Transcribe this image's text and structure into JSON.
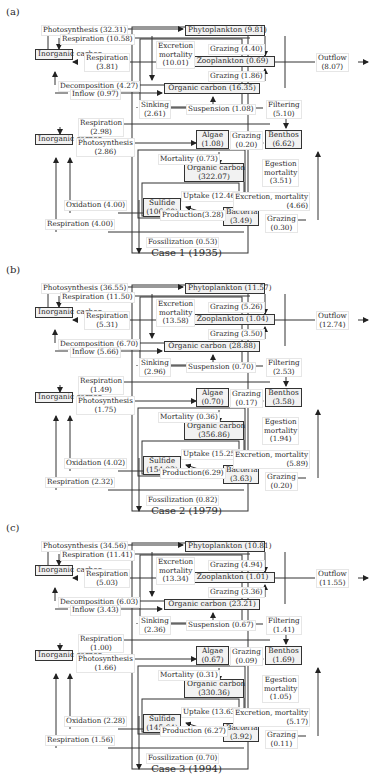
{
  "figure": {
    "cases": [
      {
        "tag": "(a)",
        "caption": "Case 1 (1935)",
        "boxes": {
          "inorganic_carbon_upper": "Inorganic carbon",
          "phytoplankton": "Phytoplankton (9.81)",
          "zooplankton": "Zooplankton (0.69)",
          "organic_carbon_water": "Organic carbon (16.35)",
          "inorganic_carbon_lower": "Inorganic carbon",
          "algae_name": "Algae",
          "algae_value": "(1.08)",
          "benthos_name": "Benthos",
          "benthos_value": "(6.62)",
          "organic_carbon_sed_name": "Organic carbon",
          "organic_carbon_sed_value": "(322.07)",
          "sulfide_name": "Sulfide",
          "sulfide_value": "(106.60)",
          "bacteria_name": "Bacteria",
          "bacteria_value": "(3.49)"
        },
        "flows": {
          "photosynthesis_upper": "Photosynthesis (32.31)",
          "respiration_upper": "Respiration (10.58)",
          "respiration_zoo_name": "Respiration",
          "respiration_zoo_value": "(3.81)",
          "decomposition": "Decomposition (4.27)",
          "inflow": "Inflow (0.97)",
          "excretion_name": "Excretion",
          "excretion_name2": "mortality",
          "excretion_value": "(10.01)",
          "grazing_phyto": "Grazing (4.40)",
          "grazing_oc": "Grazing (1.86)",
          "outflow_name": "Outflow",
          "outflow_value": "(8.07)",
          "sinking_name": "Sinking",
          "sinking_value": "(2.61)",
          "suspension": "Suspension (1.08)",
          "filtering_name": "Filtering",
          "filtering_value": "(5.10)",
          "respiration_lower_name": "Respiration",
          "respiration_lower_value": "(2.98)",
          "photosynthesis_lower_name": "Photosynthesis",
          "photosynthesis_lower_value": "(2.86)",
          "grazing_algae_name": "Grazing",
          "grazing_algae_value": "(0.20)",
          "mortality": "Mortality (0.73)",
          "egestion_name": "Egestion",
          "egestion_name2": "mortality",
          "egestion_value": "(3.51)",
          "uptake": "Uptake (12.46)",
          "excretion_bact_name": "Excretion, mortality",
          "excretion_bact_value": "(4.66)",
          "oxidation": "Oxidation (4.00)",
          "production": "Production(3.28)",
          "respiration_bottom": "Respiration (4.00)",
          "grazing_bact_name": "Grazing",
          "grazing_bact_value": "(0.30)",
          "fossilization": "Fossilization (0.53)"
        }
      },
      {
        "tag": "(b)",
        "caption": "Case 2 (1979)",
        "boxes": {
          "inorganic_carbon_upper": "Inorganic carbon",
          "phytoplankton": "Phytoplankton (11.57)",
          "zooplankton": "Zooplankton (1.04)",
          "organic_carbon_water": "Organic carbon (28.88)",
          "inorganic_carbon_lower": "Inorganic carbon",
          "algae_name": "Algae",
          "algae_value": "(0.70)",
          "benthos_name": "Benthos",
          "benthos_value": "(3.58)",
          "organic_carbon_sed_name": "Organic carbon",
          "organic_carbon_sed_value": "(356.86)",
          "sulfide_name": "Sulfide",
          "sulfide_value": "(154.23)",
          "bacteria_name": "Bacteria",
          "bacteria_value": "(3.63)"
        },
        "flows": {
          "photosynthesis_upper": "Photosynthesis (36.55)",
          "respiration_upper": "Respiration (11.50)",
          "respiration_zoo_name": "Respiration",
          "respiration_zoo_value": "(5.31)",
          "decomposition": "Decomposition (6.70)",
          "inflow": "Inflow (5.66)",
          "excretion_name": "Excretion",
          "excretion_name2": "mortality",
          "excretion_value": "(13.58)",
          "grazing_phyto": "Grazing (5.26)",
          "grazing_oc": "Grazing (3.50)",
          "outflow_name": "Outflow",
          "outflow_value": "(12.74)",
          "sinking_name": "Sinking",
          "sinking_value": "(2.96)",
          "suspension": "Suspension (0.70)",
          "filtering_name": "Filtering",
          "filtering_value": "(2.53)",
          "respiration_lower_name": "Respiration",
          "respiration_lower_value": "(1.49)",
          "photosynthesis_lower_name": "Photosynthesis",
          "photosynthesis_lower_value": "(1.75)",
          "grazing_algae_name": "Grazing",
          "grazing_algae_value": "(0.17)",
          "mortality": "Mortality (0.36)",
          "egestion_name": "Egestion",
          "egestion_name2": "mortality",
          "egestion_value": "(1.94)",
          "uptake": "Uptake (15.25)",
          "excretion_bact_name": "Excretion, mortality",
          "excretion_bact_value": "(5.89)",
          "oxidation": "Oxidation (4.02)",
          "production": "Production(6.29)",
          "respiration_bottom": "Respiration (2.32)",
          "grazing_bact_name": "Grazing",
          "grazing_bact_value": "(0.20)",
          "fossilization": "Fossilization (0.82)"
        }
      },
      {
        "tag": "(c)",
        "caption": "Case 3 (1994)",
        "boxes": {
          "inorganic_carbon_upper": "Inorganic carbon",
          "phytoplankton": "Phytoplankton (10.81)",
          "zooplankton": "Zooplankton (1.01)",
          "organic_carbon_water": "Organic carbon (23.21)",
          "inorganic_carbon_lower": "Inorganic carbon",
          "algae_name": "Algae",
          "algae_value": "(0.67)",
          "benthos_name": "Benthos",
          "benthos_value": "(1.69)",
          "organic_carbon_sed_name": "Organic carbon",
          "organic_carbon_sed_value": "(330.36)",
          "sulfide_name": "Sulfide",
          "sulfide_value": "(145.64)",
          "bacteria_name": "Bacteria",
          "bacteria_value": "(3.92)"
        },
        "flows": {
          "photosynthesis_upper": "Photosynthesis (34.56)",
          "respiration_upper": "Respiration (11.41)",
          "respiration_zoo_name": "Respiration",
          "respiration_zoo_value": "(5.03)",
          "decomposition": "Decomposition (6.03)",
          "inflow": "Inflow (3.43)",
          "excretion_name": "Excretion",
          "excretion_name2": "mortality",
          "excretion_value": "(13.34)",
          "grazing_phyto": "Grazing (4.94)",
          "grazing_oc": "Grazing (3.36)",
          "outflow_name": "Outflow",
          "outflow_value": "(11.55)",
          "sinking_name": "Sinking",
          "sinking_value": "(2.36)",
          "suspension": "Suspension (0.67)",
          "filtering_name": "Filtering",
          "filtering_value": "(1.41)",
          "respiration_lower_name": "Respiration",
          "respiration_lower_value": "(1.00)",
          "photosynthesis_lower_name": "Photosynthesis",
          "photosynthesis_lower_value": "(1.66)",
          "grazing_algae_name": "Grazing",
          "grazing_algae_value": "(0.09)",
          "mortality": "Mortality (0.31)",
          "egestion_name": "Egestion",
          "egestion_name2": "mortality",
          "egestion_value": "(1.05)",
          "uptake": "Uptake (13.63)",
          "excretion_bact_name": "Excretion, mortality",
          "excretion_bact_value": "(5.17)",
          "oxidation": "Oxidation (2.28)",
          "production": "Production (6.27)",
          "respiration_bottom": "Respiration (1.56)",
          "grazing_bact_name": "Grazing",
          "grazing_bact_value": "(0.11)",
          "fossilization": "Fossilization (0.70)"
        }
      }
    ]
  }
}
